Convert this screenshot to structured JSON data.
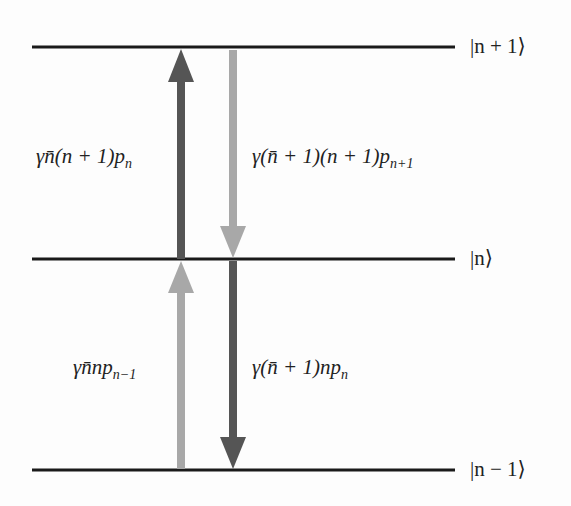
{
  "levels": [
    {
      "ket": "|n + 1⟩",
      "y": 47
    },
    {
      "ket": "|n⟩",
      "y": 259
    },
    {
      "ket": "|n − 1⟩",
      "y": 470
    }
  ],
  "transitions": [
    {
      "label": "γn̄(n + 1)p",
      "sub": "n",
      "direction": "up",
      "shade": "dark",
      "from": "|n⟩",
      "to": "|n + 1⟩"
    },
    {
      "label": "γ(n̄ + 1)(n + 1)p",
      "sub": "n+1",
      "direction": "down",
      "shade": "light",
      "from": "|n + 1⟩",
      "to": "|n⟩"
    },
    {
      "label": "γn̄np",
      "sub": "n−1",
      "direction": "up",
      "shade": "light",
      "from": "|n − 1⟩",
      "to": "|n⟩"
    },
    {
      "label": "γ(n̄ + 1)np",
      "sub": "n",
      "direction": "down",
      "shade": "dark",
      "from": "|n⟩",
      "to": "|n − 1⟩"
    }
  ],
  "colors": {
    "dark": "#555555",
    "light": "#a8a8a8",
    "line": "#1a1a1a"
  }
}
